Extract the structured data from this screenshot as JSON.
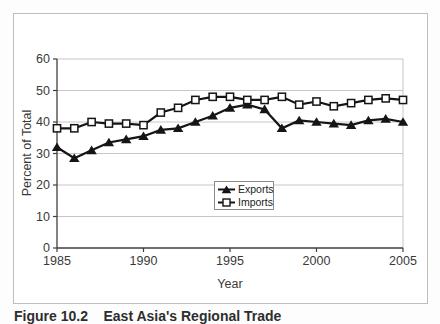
{
  "figure": {
    "caption": "Figure 10.2    East Asia's Regional Trade"
  },
  "colors": {
    "gridline": "#c6c6c6",
    "axis": "#3f3f3f",
    "text": "#3a3a3a",
    "series": "#151515",
    "frame_border": "#bdbdbd",
    "background": "#ffffff"
  },
  "chart_data": {
    "type": "line",
    "title": "",
    "xlabel": "Year",
    "ylabel": "Percent of Total",
    "xlim": [
      1985,
      2005
    ],
    "ylim": [
      0,
      60
    ],
    "xticks": [
      1985,
      1990,
      1995,
      2000,
      2005
    ],
    "yticks": [
      0,
      10,
      20,
      30,
      40,
      50,
      60
    ],
    "grid": "horizontal",
    "legend_position": "center-inside",
    "x": [
      1985,
      1986,
      1987,
      1988,
      1989,
      1990,
      1991,
      1992,
      1993,
      1994,
      1995,
      1996,
      1997,
      1998,
      1999,
      2000,
      2001,
      2002,
      2003,
      2004,
      2005
    ],
    "series": [
      {
        "name": "Exports",
        "marker": "filled-triangle",
        "color": "#151515",
        "values": [
          32,
          28.5,
          31,
          33.5,
          34.5,
          35.5,
          37.5,
          38,
          40,
          42,
          44.5,
          45.5,
          44,
          38,
          40.5,
          40,
          39.5,
          39,
          40.5,
          41,
          40
        ]
      },
      {
        "name": "Imports",
        "marker": "open-square",
        "color": "#151515",
        "values": [
          38,
          38,
          40,
          39.5,
          39.5,
          39,
          43,
          44.5,
          47,
          48,
          48,
          47,
          47,
          48,
          45.5,
          46.5,
          45,
          46,
          47,
          47.5,
          47
        ]
      }
    ]
  }
}
